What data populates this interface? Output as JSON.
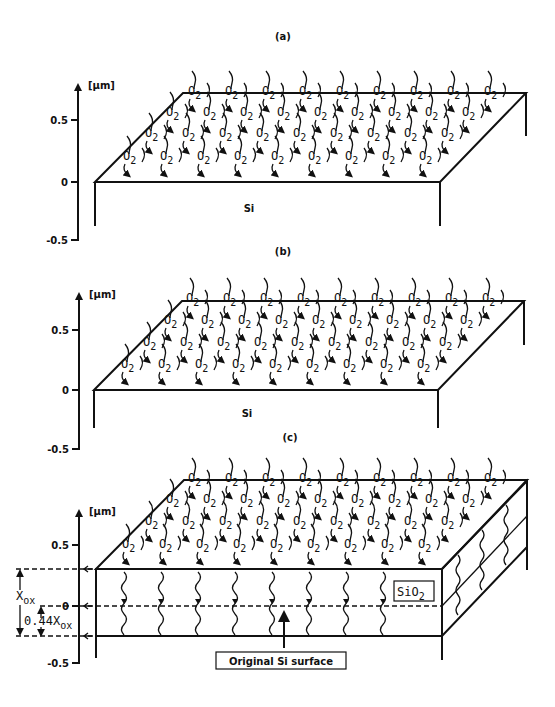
{
  "figure": {
    "panels": [
      {
        "id": "a",
        "label": "(a)",
        "axis_unit": "[µm]",
        "ticks": [
          "0.5",
          "0",
          "-0.5"
        ],
        "substrate_label": "Si",
        "top_surface": "bare",
        "species": "O",
        "species_sub": "2"
      },
      {
        "id": "b",
        "label": "(b)",
        "axis_unit": "[µm]",
        "ticks": [
          "0.5",
          "0",
          "-0.5"
        ],
        "substrate_label": "Si",
        "top_surface": "thin-oxide",
        "species": "O",
        "species_sub": "2"
      },
      {
        "id": "c",
        "label": "(c)",
        "axis_unit": "[µm]",
        "ticks": [
          "0.5",
          "0",
          "-0.5"
        ],
        "top_surface": "thick-oxide",
        "species": "O",
        "species_sub": "2",
        "oxide_label": "SiO",
        "oxide_sub": "2",
        "original_surface_label": "Original Si surface",
        "dim_xox": "X",
        "dim_xox_sub": "ox",
        "dim_044": "0.44X",
        "dim_044_sub": "ox"
      }
    ]
  }
}
